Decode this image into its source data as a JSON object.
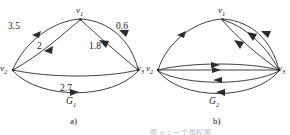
{
  "figure": {
    "background_color": "#ffffff",
    "ink_color": "#2b2b2b",
    "caption_faint": "图 6-2 一个带权图",
    "panels": [
      {
        "key": "a",
        "panel_label": "a)",
        "graph_name": "G",
        "graph_name_sub": "1",
        "vertices": [
          {
            "id": "v1",
            "label": "v",
            "sub": "1"
          },
          {
            "id": "v2",
            "label": "v",
            "sub": "2"
          },
          {
            "id": "v3",
            "label": "v",
            "sub": "3"
          }
        ],
        "edges": [
          {
            "from": "v1",
            "to": "v2",
            "weight": "3.5"
          },
          {
            "from": "v1",
            "to": "v2",
            "weight": "2"
          },
          {
            "from": "v1",
            "to": "v3",
            "weight": "0.6"
          },
          {
            "from": "v1",
            "to": "v3",
            "weight": "1.8"
          },
          {
            "from": "v2",
            "to": "v3",
            "weight": "2.7"
          }
        ],
        "weights": [
          "3.5",
          "2",
          "0.6",
          "1.8",
          "2.7"
        ]
      },
      {
        "key": "b",
        "panel_label": "b)",
        "graph_name": "G",
        "graph_name_sub": "2",
        "vertices": [
          {
            "id": "v1",
            "label": "v",
            "sub": "1"
          },
          {
            "id": "v2",
            "label": "v",
            "sub": "2"
          },
          {
            "id": "v3",
            "label": "v",
            "sub": "3"
          }
        ],
        "edges": [
          {
            "from": "v1",
            "to": "v2",
            "weight": ""
          },
          {
            "from": "v1",
            "to": "v3",
            "weight": ""
          },
          {
            "from": "v1",
            "to": "v3",
            "weight": ""
          },
          {
            "from": "v1",
            "to": "v3",
            "weight": ""
          },
          {
            "from": "v2",
            "to": "v3",
            "weight": ""
          },
          {
            "from": "v2",
            "to": "v3",
            "weight": ""
          },
          {
            "from": "v2",
            "to": "v3",
            "weight": ""
          }
        ],
        "weights": []
      }
    ]
  }
}
